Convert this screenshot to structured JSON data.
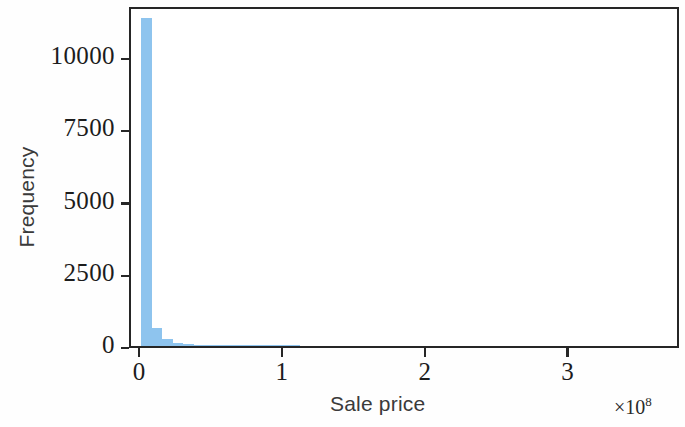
{
  "chart_data": {
    "type": "bar",
    "title": "",
    "subtitle": "",
    "xlabel": "Sale price",
    "ylabel": "Frequency",
    "x_offset_text": "×10",
    "x_offset_exponent": "8",
    "x_tick_labels": [
      "0",
      "1",
      "2",
      "3"
    ],
    "x_tick_values": [
      0,
      1,
      2,
      3
    ],
    "y_tick_labels": [
      "0",
      "2500",
      "5000",
      "7500",
      "10000"
    ],
    "y_tick_values": [
      0,
      2500,
      5000,
      7500,
      10000
    ],
    "xlim": [
      -0.07,
      3.78
    ],
    "ylim": [
      0,
      11800
    ],
    "grid": false,
    "legend": null,
    "bar_color": "#8ec4ee",
    "axis_color": "#262626",
    "bin_width_x": 0.074,
    "categories": [
      "0.00–0.07",
      "0.07–0.15",
      "0.15–0.22",
      "0.22–0.30",
      "0.30–0.37",
      "0.37–0.44",
      "0.44–0.52",
      "0.52–0.59",
      "0.59–0.67",
      "0.67–0.74",
      "0.74–0.81",
      "0.81–0.89",
      "0.89–0.96",
      "0.96–1.04",
      "1.04–1.11"
    ],
    "values": [
      11340,
      620,
      240,
      90,
      55,
      35,
      28,
      22,
      12,
      8,
      6,
      4,
      3,
      2,
      1
    ],
    "bars": [
      {
        "x0": 0.0,
        "x1": 0.074,
        "height": 11340
      },
      {
        "x0": 0.074,
        "x1": 0.148,
        "height": 620
      },
      {
        "x0": 0.148,
        "x1": 0.222,
        "height": 240
      },
      {
        "x0": 0.222,
        "x1": 0.296,
        "height": 90
      },
      {
        "x0": 0.296,
        "x1": 0.37,
        "height": 55
      },
      {
        "x0": 0.37,
        "x1": 0.444,
        "height": 35
      },
      {
        "x0": 0.444,
        "x1": 0.518,
        "height": 28
      },
      {
        "x0": 0.518,
        "x1": 0.592,
        "height": 22
      },
      {
        "x0": 0.592,
        "x1": 0.666,
        "height": 12
      },
      {
        "x0": 0.666,
        "x1": 0.74,
        "height": 8
      },
      {
        "x0": 0.74,
        "x1": 0.814,
        "height": 6
      },
      {
        "x0": 0.814,
        "x1": 0.888,
        "height": 4
      },
      {
        "x0": 0.888,
        "x1": 0.962,
        "height": 3
      },
      {
        "x0": 0.962,
        "x1": 1.036,
        "height": 2
      },
      {
        "x0": 1.036,
        "x1": 1.11,
        "height": 1
      }
    ]
  }
}
